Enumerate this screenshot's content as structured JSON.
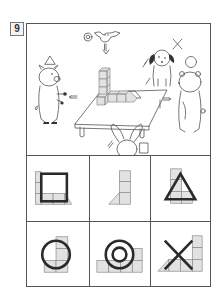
{
  "question": {
    "number": "9"
  },
  "scene": {
    "description": "Four animals and a bird look at a block structure on a table from different directions",
    "characters": [
      {
        "name": "bird",
        "position": "top",
        "symbol": "◎"
      },
      {
        "name": "dog",
        "position": "back",
        "symbol": "×"
      },
      {
        "name": "pig",
        "position": "left",
        "symbol": "△"
      },
      {
        "name": "bear",
        "position": "right",
        "symbol": "○"
      },
      {
        "name": "rabbit",
        "position": "front",
        "symbol": "□"
      }
    ]
  },
  "answers": {
    "options": [
      {
        "symbol": "□",
        "shape": "square",
        "view": "front view - tall stack on left, row of blocks, ramp on right"
      },
      {
        "symbol": "",
        "shape": "none",
        "view": "side view - column of 3 blocks with ramp on left"
      },
      {
        "symbol": "△",
        "shape": "triangle",
        "view": "side view - column of 3 blocks with row"
      },
      {
        "symbol": "○",
        "shape": "circle",
        "view": "side view - column with block"
      },
      {
        "symbol": "◎",
        "shape": "double-circle",
        "view": "top view - row of blocks"
      },
      {
        "symbol": "×",
        "shape": "cross",
        "view": "back view - ramp left, row, tall stack right"
      }
    ]
  },
  "colors": {
    "block_fill": "#e2e2e2",
    "block_stroke": "#8a8a8a",
    "line": "#555555",
    "symbol": "#2a2a2a"
  }
}
